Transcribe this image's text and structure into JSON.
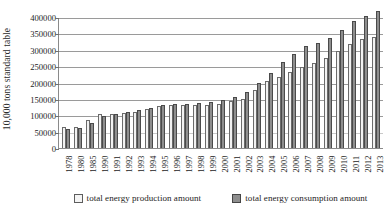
{
  "chart_data": {
    "type": "bar",
    "title": "",
    "subtitle": "",
    "xlabel": "",
    "ylabel": "10,000 tons standard table",
    "ylim": [
      0,
      400000
    ],
    "ytick_step": 50000,
    "yticks": [
      0,
      50000,
      100000,
      150000,
      200000,
      250000,
      300000,
      350000,
      400000
    ],
    "ytick_labels": [
      "0",
      "50000",
      "100000",
      "150000",
      "200000",
      "250000",
      "300000",
      "350000",
      "400000"
    ],
    "grid": true,
    "legend_position": "bottom",
    "categories": [
      "1978",
      "1980",
      "1985",
      "1990",
      "1991",
      "1992",
      "1993",
      "1994",
      "1995",
      "1996",
      "1997",
      "1998",
      "1999",
      "2000",
      "2001",
      "2002",
      "2003",
      "2004",
      "2005",
      "2006",
      "2007",
      "2008",
      "2009",
      "2010",
      "2011",
      "2012",
      "2013"
    ],
    "series": [
      {
        "name": "total energy production amount",
        "color": "#f2f2f2",
        "values": [
          62770,
          63735,
          85546,
          103922,
          104844,
          107256,
          111059,
          118729,
          129034,
          132616,
          132410,
          129834,
          131935,
          135048,
          143875,
          150656,
          178299,
          206108,
          216219,
          232167,
          247279,
          260552,
          274619,
          296916,
          317987,
          331848,
          340000
        ]
      },
      {
        "name": "total energy consumption amount",
        "color": "#8e8e8e",
        "values": [
          57144,
          60275,
          76682,
          98703,
          103783,
          109170,
          115993,
          122737,
          131176,
          135192,
          135909,
          136184,
          140569,
          146964,
          155547,
          169577,
          197083,
          230281,
          261369,
          286467,
          311442,
          320611,
          336126,
          360648,
          387043,
          402138,
          416913
        ]
      }
    ],
    "note_series_scaled": "bar heights are read from the gridlines of the rendered figure"
  },
  "legend": {
    "items": [
      {
        "label": "total energy production amount",
        "swatch": "production"
      },
      {
        "label": "total energy consumption amount",
        "swatch": "consumption"
      }
    ]
  },
  "axes": {
    "y_title": "10,000 tons standard table"
  }
}
